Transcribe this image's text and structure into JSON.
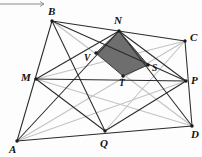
{
  "figure": {
    "width": 202,
    "height": 157,
    "background": "#fdfdfd",
    "colors": {
      "outline": "#2a2a2a",
      "light_line": "#c3c3c3",
      "shaded_fill": "#6e6e6e",
      "shaded_stroke": "#3a3a3a",
      "vertex_dot": "#1a1a1a",
      "ruler": "#8a8a8a"
    },
    "ruler": {
      "x1": 0,
      "y1": 4,
      "x2": 44,
      "y2": 4,
      "arrow": true
    },
    "points": {
      "A": {
        "x": 17,
        "y": 141,
        "label": "A",
        "lx": 9,
        "ly": 144
      },
      "B": {
        "x": 52,
        "y": 21,
        "label": "B",
        "lx": 48,
        "ly": 6
      },
      "C": {
        "x": 185,
        "y": 41,
        "label": "C",
        "lx": 190,
        "ly": 32
      },
      "D": {
        "x": 192,
        "y": 126,
        "label": "D",
        "lx": 191,
        "ly": 129
      },
      "M": {
        "x": 36,
        "y": 79,
        "label": "M",
        "lx": 21,
        "ly": 72
      },
      "N": {
        "x": 119,
        "y": 31,
        "label": "N",
        "lx": 114,
        "ly": 15
      },
      "P": {
        "x": 186,
        "y": 81,
        "label": "P",
        "lx": 191,
        "ly": 75
      },
      "Q": {
        "x": 105,
        "y": 131,
        "label": "Q",
        "lx": 100,
        "ly": 138
      },
      "V": {
        "x": 96,
        "y": 53,
        "label": "V",
        "lx": 84,
        "ly": 54
      },
      "S": {
        "x": 148,
        "y": 65,
        "label": "S",
        "lx": 152,
        "ly": 64
      },
      "T": {
        "x": 123,
        "y": 76,
        "label": "T",
        "lx": 119,
        "ly": 79
      }
    },
    "shaded_polygon": [
      "N",
      "V",
      "T",
      "S"
    ],
    "dark_edges": [
      [
        "A",
        "B"
      ],
      [
        "B",
        "C"
      ],
      [
        "C",
        "D"
      ],
      [
        "D",
        "A"
      ],
      [
        "M",
        "N"
      ],
      [
        "N",
        "P"
      ],
      [
        "P",
        "Q"
      ],
      [
        "Q",
        "M"
      ],
      [
        "B",
        "Q"
      ],
      [
        "B",
        "P"
      ],
      [
        "A",
        "N"
      ],
      [
        "N",
        "D"
      ],
      [
        "M",
        "P"
      ]
    ],
    "light_edges": [
      [
        "A",
        "C"
      ],
      [
        "B",
        "D"
      ],
      [
        "M",
        "D"
      ],
      [
        "A",
        "P"
      ],
      [
        "Q",
        "C"
      ],
      [
        "M",
        "C"
      ]
    ],
    "vertex_dots": [
      "A",
      "B",
      "C",
      "D",
      "M",
      "N",
      "P",
      "Q",
      "V",
      "S",
      "T"
    ]
  }
}
